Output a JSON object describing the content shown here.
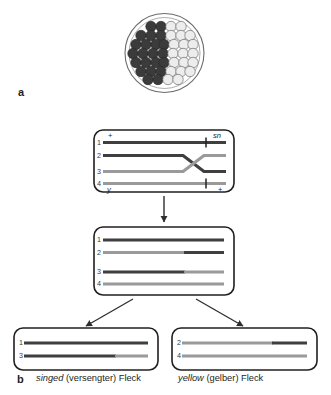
{
  "figure": {
    "panels": [
      {
        "id": "a",
        "letter": "a"
      },
      {
        "id": "b",
        "letter": "b"
      }
    ]
  },
  "panel_a": {
    "name": "imaginal-disc-cell-clone",
    "description": "circular disc of cells, left half dark, right half light",
    "colors": {
      "dark_cell": "#3b3b3b",
      "light_cell": "#e8e8e8",
      "outline": "#4a4a4a",
      "disc_border": "#5a5a5a"
    },
    "cell_layout": {
      "rows": 7,
      "dark_per_row": [
        2,
        3,
        4,
        4,
        4,
        3,
        2
      ],
      "light_per_row": [
        2,
        3,
        4,
        4,
        4,
        3,
        2
      ]
    }
  },
  "panel_b": {
    "box_meiosis": {
      "name": "crossing-over-box",
      "chromatid_numbers": [
        "1",
        "2",
        "3",
        "4"
      ],
      "labels": {
        "top_left": "+",
        "top_right": "sn",
        "bottom_left": "y",
        "bottom_right": "+"
      },
      "chromatids": [
        {
          "num": "1",
          "color": "dark",
          "tick": true,
          "crossing": false
        },
        {
          "num": "2",
          "color": "dark",
          "tick": false,
          "crossing": true
        },
        {
          "num": "3",
          "color": "light",
          "tick": false,
          "crossing": true
        },
        {
          "num": "4",
          "color": "light",
          "tick": true,
          "crossing": false
        }
      ]
    },
    "box_recombinant": {
      "name": "recombinant-chromatids-box",
      "chromatids": [
        {
          "num": "1",
          "left": "dark",
          "right": "dark"
        },
        {
          "num": "2",
          "left": "light",
          "right": "dark"
        },
        {
          "num": "3",
          "left": "dark",
          "right": "light"
        },
        {
          "num": "4",
          "left": "light",
          "right": "light"
        }
      ]
    },
    "box_singed": {
      "name": "singed-spot-box",
      "chromatids": [
        {
          "num": "1",
          "left": "dark",
          "right": "dark"
        },
        {
          "num": "3",
          "left": "dark",
          "right": "light"
        }
      ],
      "caption_italic": "singed",
      "caption_rest": "(versengter) Fleck"
    },
    "box_yellow": {
      "name": "yellow-spot-box",
      "chromatids": [
        {
          "num": "2",
          "left": "light",
          "right": "dark"
        },
        {
          "num": "4",
          "left": "light",
          "right": "light"
        }
      ],
      "caption_italic": "yellow",
      "caption_rest": "(gelber) Fleck"
    }
  },
  "colors": {
    "dark_chromatid": "#3f3f3f",
    "light_chromatid": "#9a9a9a",
    "box_stroke": "#231f20",
    "arrow": "#3a3a3a",
    "background": "#ffffff"
  }
}
